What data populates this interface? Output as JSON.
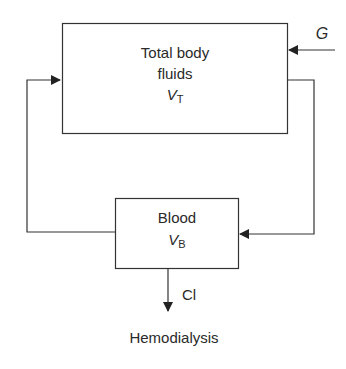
{
  "diagram": {
    "type": "compartment-model",
    "nodes": [
      {
        "id": "total_body_fluids",
        "label_lines": [
          "Total body",
          "fluids"
        ],
        "volume_symbol": "V",
        "volume_subscript": "T"
      },
      {
        "id": "blood",
        "label_lines": [
          "Blood"
        ],
        "volume_symbol": "V",
        "volume_subscript": "B"
      }
    ],
    "edges": [
      {
        "from": "input",
        "to": "total_body_fluids",
        "label": "G"
      },
      {
        "from": "total_body_fluids",
        "to": "blood",
        "label": ""
      },
      {
        "from": "blood",
        "to": "total_body_fluids",
        "label": ""
      },
      {
        "from": "blood",
        "to": "output",
        "label": "Cl"
      }
    ],
    "input_label": "G",
    "output_label": "Cl",
    "caption": "Hemodialysis"
  }
}
